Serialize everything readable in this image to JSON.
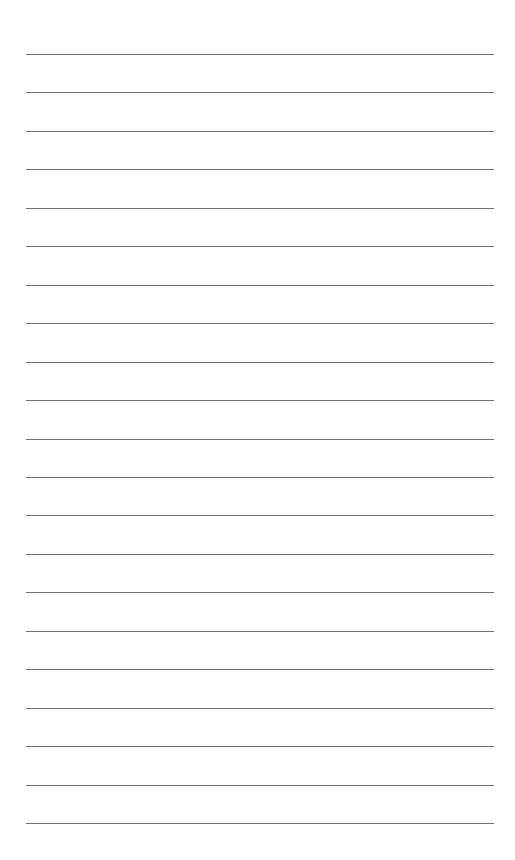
{
  "page": {
    "type": "lined-paper",
    "background_color": "#ffffff",
    "line_color": "#6f6f6f",
    "line_count": 21,
    "first_line_y": 54,
    "line_spacing": 38.45,
    "line_left": 26,
    "line_right": 494
  }
}
